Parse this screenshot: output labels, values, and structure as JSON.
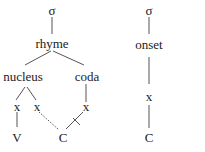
{
  "left_tree": {
    "syllable": "σ",
    "rhyme": "rhyme",
    "nucleus": "nucleus",
    "coda": "coda",
    "x1": "x",
    "x2": "x",
    "x3": "x",
    "v": "V",
    "c": "C"
  },
  "right_tree": {
    "syllable": "σ",
    "onset": "onset",
    "x": "x",
    "c": "C"
  },
  "colors": {
    "ink": "#222222",
    "line": "#555555"
  }
}
